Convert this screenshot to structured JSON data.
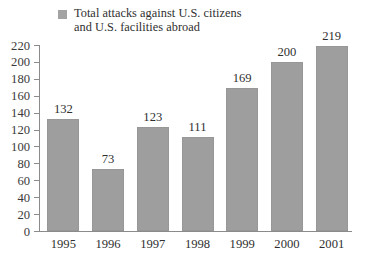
{
  "legend": {
    "label": "Total attacks against U.S. citizens\nand U.S. facilities abroad",
    "swatch_color": "#a3a3a3"
  },
  "chart_data": {
    "type": "bar",
    "title": "",
    "subtitle": "",
    "xlabel": "",
    "ylabel": "",
    "categories": [
      "1995",
      "1996",
      "1997",
      "1998",
      "1999",
      "2000",
      "2001"
    ],
    "values": [
      132,
      73,
      123,
      111,
      169,
      200,
      219
    ],
    "series": [
      {
        "name": "Total attacks against U.S. citizens and U.S. facilities abroad",
        "values": [
          132,
          73,
          123,
          111,
          169,
          200,
          219
        ]
      }
    ],
    "ylim": [
      0,
      220
    ],
    "ytick_step": 20,
    "yticks": [
      0,
      20,
      40,
      60,
      80,
      100,
      120,
      140,
      160,
      180,
      200,
      220
    ],
    "ytick_labels": [
      "0",
      "20",
      "40",
      "60",
      "80",
      "100",
      "120",
      "140",
      "160",
      "180",
      "200",
      "220"
    ],
    "grid": false,
    "legend_position": "top-left",
    "bar_color": "#9e9e9e",
    "axis_color": "#8b8b8b",
    "data_labels": [
      "132",
      "73",
      "123",
      "111",
      "169",
      "200",
      "219"
    ]
  }
}
